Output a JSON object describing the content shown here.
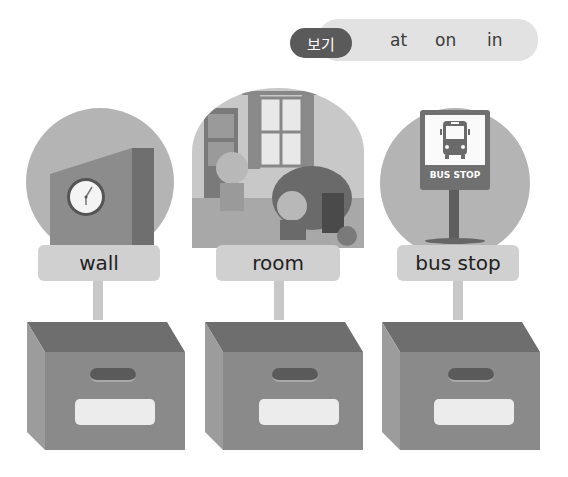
{
  "word_bank": {
    "tag_label": "보기",
    "words": [
      "at",
      "on",
      "in"
    ]
  },
  "items": [
    {
      "label": "wall",
      "picture": "wall-with-clock"
    },
    {
      "label": "room",
      "picture": "kids-bedroom"
    },
    {
      "label": "bus stop",
      "picture": "bus-stop-sign"
    }
  ],
  "bus_sign_text": "BUS STOP",
  "colors": {
    "tag_bg": "#5a5a5a",
    "bank_bg": "#e2e2e2",
    "label_bg": "#d0d0d0",
    "box_front": "#8a8a8a",
    "box_inner": "#6e6e6e"
  }
}
